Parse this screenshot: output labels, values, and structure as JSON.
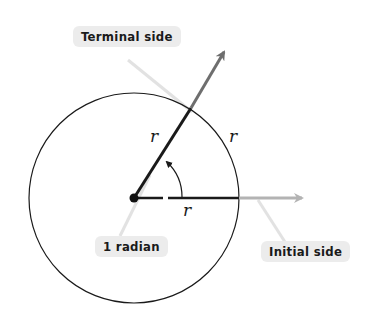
{
  "diagram": {
    "labels": {
      "terminal_side": "Terminal side",
      "initial_side": "Initial side",
      "angle": "1 radian",
      "radius_terminal": "r",
      "radius_arc": "r",
      "radius_initial": "r"
    },
    "geometry": {
      "center": [
        134,
        198
      ],
      "radius": 105,
      "terminal_tip": [
        225,
        50
      ],
      "initial_tip": [
        303,
        198
      ]
    },
    "colors": {
      "line": "#1a1a1a",
      "arrow_gray": "#7a7a7a",
      "arrow_light": "#b0b0b0",
      "callout_bg": "#ececec",
      "leader": "#e0e0e0"
    }
  }
}
